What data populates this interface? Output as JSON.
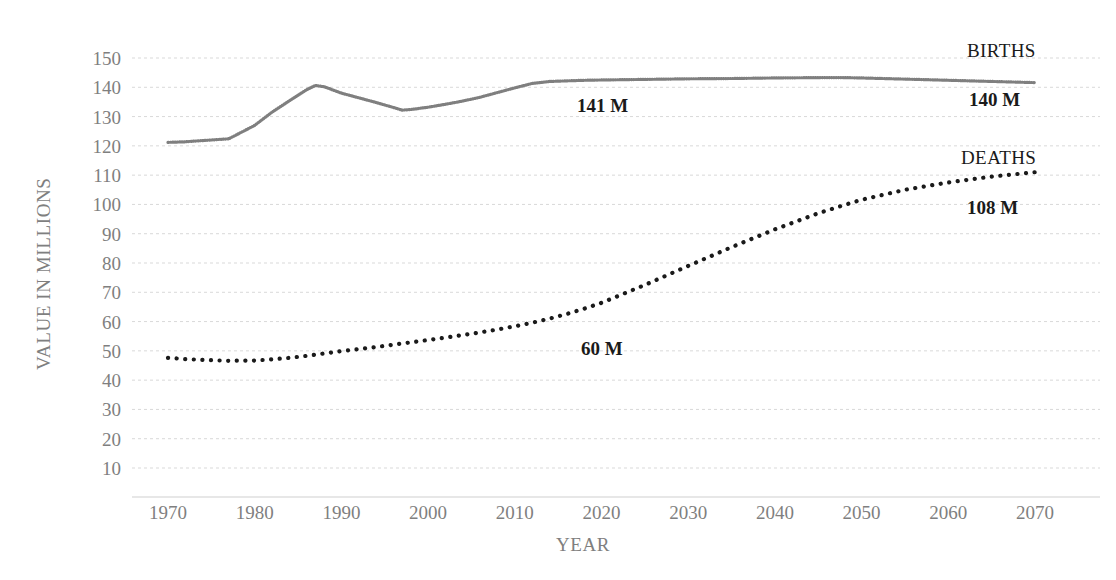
{
  "chart_data": {
    "type": "line",
    "title": "",
    "xlabel": "YEAR",
    "ylabel": "VALUE IN MILLIONS",
    "xlim": [
      1966,
      2074
    ],
    "ylim": [
      0,
      155
    ],
    "grid": true,
    "legend_position": "inline-right",
    "y_ticks": [
      150,
      140,
      130,
      120,
      110,
      100,
      90,
      80,
      70,
      60,
      50,
      40,
      30,
      20,
      10
    ],
    "x_ticks": [
      1970,
      1980,
      1990,
      2000,
      2010,
      2020,
      2030,
      2040,
      2050,
      2060,
      2070
    ],
    "x": [
      1970,
      1972,
      1974,
      1976,
      1977,
      1980,
      1982,
      1984,
      1986,
      1987,
      1988,
      1990,
      1992,
      1994,
      1996,
      1997,
      1998,
      2000,
      2002,
      2004,
      2006,
      2008,
      2010,
      2012,
      2014,
      2016,
      2018,
      2020,
      2025,
      2030,
      2035,
      2040,
      2045,
      2048,
      2050,
      2055,
      2060,
      2065,
      2070
    ],
    "series": [
      {
        "name": "BIRTHS",
        "style": "dense-dotted",
        "color": "#7f7f7f",
        "values": [
          121.2,
          121.4,
          121.8,
          122.2,
          122.4,
          127.0,
          131.5,
          135.4,
          139.2,
          140.6,
          140.2,
          138.0,
          136.4,
          134.8,
          133.1,
          132.2,
          132.4,
          133.2,
          134.2,
          135.3,
          136.6,
          138.2,
          139.8,
          141.3,
          142.0,
          142.2,
          142.4,
          142.5,
          142.7,
          142.9,
          143.0,
          143.2,
          143.3,
          143.3,
          143.2,
          142.8,
          142.4,
          142.0,
          141.6
        ]
      },
      {
        "name": "DEATHS",
        "style": "dotted",
        "color": "#1a1a1a",
        "values": [
          47.6,
          47.2,
          46.9,
          46.7,
          46.6,
          46.7,
          47.1,
          47.6,
          48.3,
          48.7,
          49.1,
          49.9,
          50.6,
          51.3,
          52.1,
          52.5,
          52.9,
          53.7,
          54.5,
          55.4,
          56.3,
          57.3,
          58.4,
          59.6,
          61.0,
          62.6,
          64.4,
          66.4,
          72.5,
          79.0,
          85.4,
          91.5,
          97.0,
          99.8,
          101.6,
          105.0,
          107.5,
          109.5,
          111.0
        ]
      }
    ],
    "annotations": [
      {
        "id": "births-series-label",
        "text": "BIRTHS",
        "x_px": 967,
        "y_px": 57
      },
      {
        "id": "births-mid-value",
        "text": "141 M",
        "x_px": 577,
        "y_px": 112
      },
      {
        "id": "births-end-value",
        "text": "140 M",
        "x_px": 969,
        "y_px": 106
      },
      {
        "id": "deaths-series-label",
        "text": "DEATHS",
        "x_px": 961,
        "y_px": 164
      },
      {
        "id": "deaths-end-value",
        "text": "108 M",
        "x_px": 967,
        "y_px": 214
      },
      {
        "id": "deaths-mid-value",
        "text": "60 M",
        "x_px": 581,
        "y_px": 355
      }
    ]
  }
}
